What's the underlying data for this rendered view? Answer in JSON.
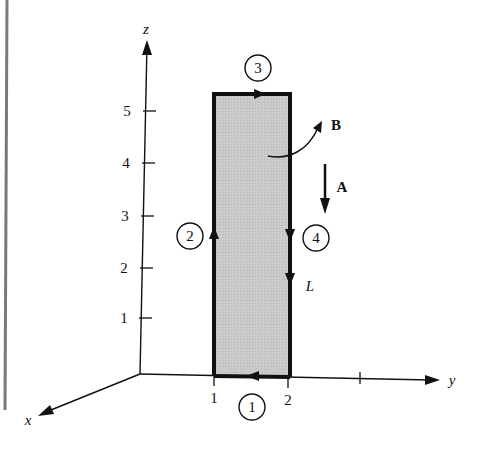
{
  "figure": {
    "axes": {
      "z_label": "z",
      "y_label": "y",
      "x_label": "x",
      "z_ticks": [
        "1",
        "2",
        "3",
        "4",
        "5"
      ],
      "y_ticks": [
        "1",
        "2"
      ]
    },
    "loop": {
      "segments": [
        {
          "id": "1",
          "label": "1"
        },
        {
          "id": "2",
          "label": "2"
        },
        {
          "id": "3",
          "label": "3"
        },
        {
          "id": "4",
          "label": "4"
        }
      ],
      "path_label": "L",
      "fill_color": "#c8c8c8",
      "border_color": "#111111"
    },
    "vectors": {
      "A_label": "A",
      "B_label": "B"
    },
    "colors": {
      "ink": "#111111",
      "margin_rule": "#7a7a7a",
      "background": "#ffffff"
    }
  }
}
